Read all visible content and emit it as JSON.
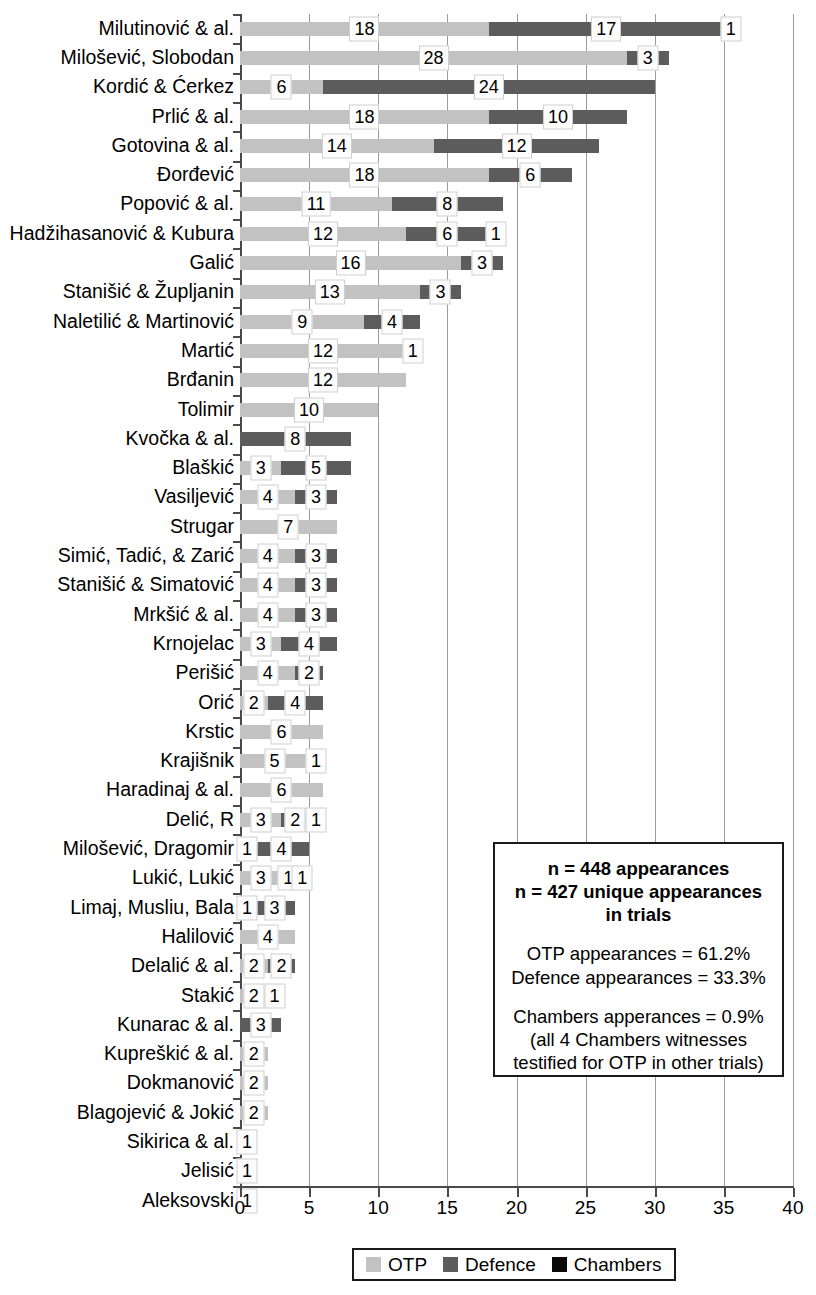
{
  "chart_data": {
    "type": "bar",
    "orientation": "horizontal",
    "stacked": true,
    "title": "",
    "xlabel": "",
    "ylabel": "",
    "xlim": [
      0,
      40
    ],
    "xticks": [
      "0",
      "5",
      "10",
      "15",
      "20",
      "25",
      "30",
      "35",
      "40"
    ],
    "grid": true,
    "legend_position": "bottom",
    "categories": [
      "Milutinović & al.",
      "Milošević, Slobodan",
      "Kordić & Ćerkez",
      "Prlić & al.",
      "Gotovina & al.",
      "Đorđević",
      "Popović & al.",
      "Hadžihasanović & Kubura",
      "Galić",
      "Stanišić & Župljanin",
      "Naletilić & Martinović",
      "Martić",
      "Brđanin",
      "Tolimir",
      "Kvočka & al.",
      "Blaškić",
      "Vasiljević",
      "Strugar",
      "Simić, Tadić, & Zarić",
      "Stanišić & Simatović",
      "Mrkšić & al.",
      "Krnojelac",
      "Perišić",
      "Orić",
      "Krstic",
      "Krajišnik",
      "Haradinaj & al.",
      "Delić, R",
      "Milošević, Dragomir",
      "Lukić, Lukić",
      "Limaj, Musliu, Bala",
      "Halilović",
      "Delalić & al.",
      "Stakić",
      "Kunarac & al.",
      "Kupreškić & al.",
      "Dokmanović",
      "Blagojević & Jokić",
      "Sikirica & al.",
      "Jelisić",
      "Aleksovski"
    ],
    "series": [
      {
        "name": "OTP",
        "color": "#c2c2c2",
        "values": [
          18,
          28,
          6,
          18,
          14,
          18,
          11,
          12,
          16,
          13,
          9,
          12,
          12,
          10,
          0,
          3,
          4,
          7,
          4,
          4,
          4,
          3,
          4,
          2,
          6,
          5,
          6,
          3,
          1,
          3,
          1,
          4,
          2,
          2,
          0,
          2,
          2,
          2,
          1,
          1,
          1
        ]
      },
      {
        "name": "Defence",
        "color": "#5c5c5c",
        "values": [
          17,
          3,
          24,
          10,
          12,
          6,
          8,
          6,
          3,
          3,
          4,
          1,
          0,
          0,
          8,
          5,
          3,
          0,
          3,
          3,
          3,
          4,
          2,
          4,
          0,
          1,
          0,
          2,
          4,
          1,
          3,
          0,
          2,
          1,
          3,
          0,
          0,
          0,
          0,
          0,
          0
        ]
      },
      {
        "name": "Chambers",
        "color": "#0a0a0a",
        "values": [
          1,
          0,
          0,
          0,
          0,
          0,
          0,
          1,
          0,
          0,
          0,
          0,
          0,
          0,
          0,
          0,
          0,
          0,
          0,
          0,
          0,
          0,
          0,
          0,
          0,
          0,
          0,
          1,
          0,
          1,
          0,
          0,
          0,
          0,
          0,
          0,
          0,
          0,
          0,
          0,
          0
        ]
      }
    ],
    "totals": [
      36,
      31,
      30,
      28,
      26,
      24,
      19,
      19,
      19,
      16,
      13,
      13,
      12,
      10,
      8,
      8,
      7,
      7,
      7,
      7,
      7,
      7,
      6,
      6,
      6,
      6,
      6,
      6,
      5,
      5,
      4,
      4,
      4,
      3,
      3,
      2,
      2,
      2,
      1,
      1,
      1
    ]
  },
  "legend": {
    "items": [
      {
        "label": "OTP",
        "color": "#c2c2c2"
      },
      {
        "label": "Defence",
        "color": "#5c5c5c"
      },
      {
        "label": "Chambers",
        "color": "#0a0a0a"
      }
    ]
  },
  "annotation": {
    "line1": "n = 448 appearances",
    "line2": "n = 427 unique appearances",
    "line3": "in trials",
    "line4": "OTP appearances = 61.2%",
    "line5": "Defence appearances = 33.3%",
    "line6": "Chambers apperances = 0.9%",
    "line7": "(all 4 Chambers witnesses",
    "line8": "testified for OTP in other trials)"
  }
}
